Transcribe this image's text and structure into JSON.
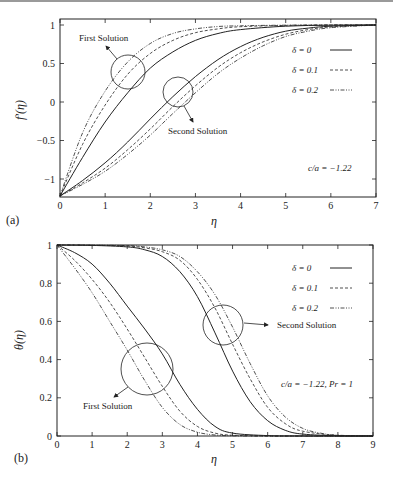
{
  "chart_data": [
    {
      "type": "line",
      "panel_label": "(a)",
      "title": "",
      "xlabel": "η",
      "ylabel": "f′(η)",
      "xlim": [
        0,
        7
      ],
      "ylim": [
        -1.22,
        1.05
      ],
      "xticks": [
        0,
        1,
        2,
        3,
        4,
        5,
        6,
        7
      ],
      "yticks": [
        {
          "v": 1,
          "label": "1"
        },
        {
          "v": 0.5,
          "label": "0.5"
        },
        {
          "v": 0,
          "label": "0"
        },
        {
          "v": -0.5,
          "label": "−0.5"
        },
        {
          "v": -1,
          "label": "−1"
        }
      ],
      "grid": false,
      "legend_position": "upper right",
      "legend": [
        {
          "label": "δ = 0",
          "style": "solid"
        },
        {
          "label": "δ = 0.1",
          "style": "dashed"
        },
        {
          "label": "δ = 0.2",
          "style": "dashdotdot"
        }
      ],
      "annotations": [
        {
          "text": "First Solution",
          "x": 1.5,
          "y": 0.4
        },
        {
          "text": "Second Solution",
          "x": 2.65,
          "y": 0.15
        },
        {
          "text": "c/a = −1.22"
        }
      ],
      "series": [
        {
          "name": "δ = 0 (first)",
          "style": "solid",
          "x": [
            0,
            0.5,
            1,
            1.5,
            2,
            2.5,
            3,
            3.5,
            4,
            5,
            6,
            7
          ],
          "y": [
            -1.22,
            -0.72,
            -0.26,
            0.12,
            0.44,
            0.65,
            0.8,
            0.89,
            0.94,
            0.985,
            0.998,
            1.0
          ]
        },
        {
          "name": "δ = 0.1 (first)",
          "style": "dashed",
          "x": [
            0,
            0.5,
            1,
            1.5,
            2,
            2.5,
            3,
            3.5,
            4,
            5,
            6,
            7
          ],
          "y": [
            -1.22,
            -0.55,
            -0.04,
            0.36,
            0.63,
            0.8,
            0.9,
            0.95,
            0.978,
            0.995,
            1.0,
            1.0
          ]
        },
        {
          "name": "δ = 0.2 (first)",
          "style": "dashdotdot",
          "x": [
            0,
            0.5,
            1,
            1.5,
            2,
            2.5,
            3,
            3.5,
            4,
            5,
            6,
            7
          ],
          "y": [
            -1.22,
            -0.4,
            0.14,
            0.52,
            0.76,
            0.89,
            0.95,
            0.98,
            0.99,
            0.998,
            1.0,
            1.0
          ]
        },
        {
          "name": "δ = 0 (second)",
          "style": "solid",
          "x": [
            0,
            0.5,
            1,
            1.5,
            2,
            2.5,
            3,
            3.5,
            4,
            4.5,
            5,
            5.5,
            6,
            7
          ],
          "y": [
            -1.22,
            -1.02,
            -0.79,
            -0.52,
            -0.22,
            0.07,
            0.33,
            0.55,
            0.72,
            0.84,
            0.92,
            0.96,
            0.985,
            1.0
          ]
        },
        {
          "name": "δ = 0.1 (second)",
          "style": "dashed",
          "x": [
            0,
            0.5,
            1,
            1.5,
            2,
            2.5,
            3,
            3.5,
            4,
            4.5,
            5,
            5.5,
            6,
            7
          ],
          "y": [
            -1.22,
            -1.05,
            -0.86,
            -0.62,
            -0.35,
            -0.06,
            0.21,
            0.45,
            0.64,
            0.78,
            0.88,
            0.94,
            0.975,
            1.0
          ]
        },
        {
          "name": "δ = 0.2 (second)",
          "style": "dashdotdot",
          "x": [
            0,
            0.5,
            1,
            1.5,
            2,
            2.5,
            3,
            3.5,
            4,
            4.5,
            5,
            5.5,
            6,
            7
          ],
          "y": [
            -1.22,
            -1.07,
            -0.9,
            -0.68,
            -0.43,
            -0.15,
            0.12,
            0.37,
            0.57,
            0.73,
            0.85,
            0.92,
            0.965,
            1.0
          ]
        }
      ]
    },
    {
      "type": "line",
      "panel_label": "(b)",
      "title": "",
      "xlabel": "η",
      "ylabel": "θ(η)",
      "xlim": [
        0,
        9
      ],
      "ylim": [
        0,
        1
      ],
      "xticks": [
        0,
        1,
        2,
        3,
        4,
        5,
        6,
        7,
        8,
        9
      ],
      "yticks": [
        {
          "v": 0,
          "label": "0"
        },
        {
          "v": 0.2,
          "label": "0.2"
        },
        {
          "v": 0.4,
          "label": "0.4"
        },
        {
          "v": 0.6,
          "label": "0.6"
        },
        {
          "v": 0.8,
          "label": "0.8"
        },
        {
          "v": 1,
          "label": "1"
        }
      ],
      "grid": false,
      "legend_position": "upper right",
      "legend": [
        {
          "label": "δ = 0",
          "style": "solid"
        },
        {
          "label": "δ = 0.1",
          "style": "dashed"
        },
        {
          "label": "δ = 0.2",
          "style": "dashdotdot"
        }
      ],
      "annotations": [
        {
          "text": "Second Solution",
          "x": 4.8,
          "y": 0.58
        },
        {
          "text": "First Solution",
          "x": 2.6,
          "y": 0.37
        },
        {
          "text": "c/a = −1.22,  Pr = 1"
        }
      ],
      "series": [
        {
          "name": "δ = 0 (first)",
          "style": "solid",
          "x": [
            0,
            0.5,
            1,
            1.5,
            2,
            2.5,
            3,
            3.5,
            4,
            4.5,
            5,
            6,
            7,
            9
          ],
          "y": [
            1,
            0.96,
            0.9,
            0.8,
            0.68,
            0.56,
            0.43,
            0.27,
            0.14,
            0.05,
            0.015,
            0.002,
            0,
            0
          ]
        },
        {
          "name": "δ = 0.1 (first)",
          "style": "dashed",
          "x": [
            0,
            0.5,
            1,
            1.5,
            2,
            2.5,
            3,
            3.5,
            4,
            4.5,
            5,
            6,
            7,
            9
          ],
          "y": [
            1,
            0.92,
            0.82,
            0.7,
            0.56,
            0.41,
            0.26,
            0.13,
            0.05,
            0.015,
            0.004,
            0,
            0,
            0
          ]
        },
        {
          "name": "δ = 0.2 (first)",
          "style": "dashdotdot",
          "x": [
            0,
            0.5,
            1,
            1.5,
            2,
            2.5,
            3,
            3.5,
            4,
            4.5,
            5,
            6,
            7,
            9
          ],
          "y": [
            1,
            0.88,
            0.75,
            0.6,
            0.45,
            0.29,
            0.15,
            0.06,
            0.02,
            0.005,
            0.001,
            0,
            0,
            0
          ]
        },
        {
          "name": "δ = 0 (second)",
          "style": "solid",
          "x": [
            0,
            1,
            2,
            2.5,
            3,
            3.5,
            4,
            4.5,
            5,
            5.5,
            6,
            6.5,
            7,
            8,
            9
          ],
          "y": [
            1,
            0.998,
            0.99,
            0.975,
            0.94,
            0.86,
            0.73,
            0.54,
            0.34,
            0.18,
            0.08,
            0.03,
            0.01,
            0.001,
            0
          ]
        },
        {
          "name": "δ = 0.1 (second)",
          "style": "dashed",
          "x": [
            0,
            1,
            2,
            2.5,
            3,
            3.5,
            4,
            4.5,
            5,
            5.5,
            6,
            6.5,
            7,
            8,
            9
          ],
          "y": [
            1,
            0.999,
            0.995,
            0.985,
            0.965,
            0.92,
            0.82,
            0.67,
            0.48,
            0.3,
            0.15,
            0.065,
            0.025,
            0.003,
            0
          ]
        },
        {
          "name": "δ = 0.2 (second)",
          "style": "dashdotdot",
          "x": [
            0,
            1,
            2,
            2.5,
            3,
            3.5,
            4,
            4.5,
            5,
            5.5,
            6,
            6.5,
            7,
            7.5,
            8,
            9
          ],
          "y": [
            1,
            0.999,
            0.997,
            0.99,
            0.975,
            0.94,
            0.86,
            0.74,
            0.57,
            0.38,
            0.21,
            0.1,
            0.04,
            0.015,
            0.004,
            0
          ]
        }
      ]
    }
  ]
}
